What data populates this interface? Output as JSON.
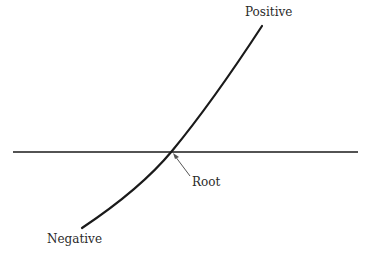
{
  "diagram": {
    "title": "",
    "labels": {
      "positive": "Positive",
      "negative": "Negative",
      "root": "Root"
    },
    "colors": {
      "background": "#ffffff",
      "curve": "#1a1a1a",
      "axis": "#1a1a1a",
      "arrow": "#555555",
      "text": "#2a2a2a"
    },
    "axis": {
      "x_start": 13,
      "x_end": 358,
      "y": 152
    },
    "curve": {
      "start": [
        82,
        228
      ],
      "root": [
        172,
        151
      ],
      "end": [
        262,
        26
      ],
      "description": "Monotonically increasing curve crossing the horizontal axis from negative to positive"
    },
    "root_arrow": {
      "from": [
        190,
        176
      ],
      "to": [
        174,
        155
      ]
    }
  }
}
